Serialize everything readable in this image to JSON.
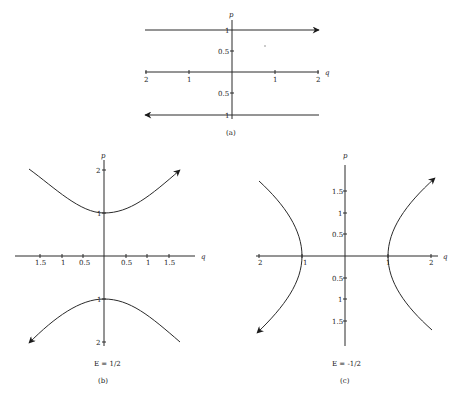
{
  "figure": {
    "panels": [
      {
        "id": "a",
        "caption": "(a)",
        "energy_label": "",
        "axes": {
          "x_label": "q",
          "y_label": "p"
        },
        "x_ticks": {
          "left": [
            "2",
            "1"
          ],
          "right": [
            "1",
            "2"
          ]
        },
        "y_ticks": {
          "top": [
            "1",
            "0.5"
          ],
          "bottom": [
            "0.5",
            "1"
          ]
        },
        "description": "Two horizontal trajectories at p=1 (arrow right) and p=-1 (arrow left)"
      },
      {
        "id": "b",
        "caption": "(b)",
        "energy_label": "E = 1/2",
        "axes": {
          "x_label": "q",
          "y_label": "p"
        },
        "x_ticks": {
          "left": [
            "1.5",
            "1",
            "0.5"
          ],
          "right": [
            "0.5",
            "1",
            "1.5"
          ]
        },
        "y_ticks": {
          "top": [
            "2",
            "1"
          ],
          "bottom": [
            "1",
            "2"
          ]
        },
        "description": "Hyperbola branches opening up/down, vertices at p=±1; upper arrow to upper right, lower arrow to lower left"
      },
      {
        "id": "c",
        "caption": "(c)",
        "energy_label": "E = -1/2",
        "axes": {
          "x_label": "q",
          "y_label": "p"
        },
        "x_ticks": {
          "left": [
            "2",
            "1"
          ],
          "right": [
            "1",
            "2"
          ]
        },
        "y_ticks": {
          "top": [
            "1.5",
            "1",
            "0.5"
          ],
          "bottom": [
            "0.5",
            "1",
            "1.5"
          ]
        },
        "description": "Hyperbola branches opening left/right, vertices at q=±1; right arrow to upper right, left arrow to lower left"
      }
    ]
  }
}
